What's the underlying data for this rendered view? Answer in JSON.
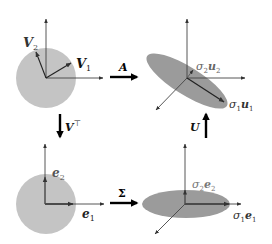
{
  "diagram": {
    "colors": {
      "circle_fill": "#c4c4c4",
      "ellipse_fill": "#9b9b9b",
      "axis": "#444444",
      "vector": "#222222",
      "big_arrow": "#000000",
      "label_gray": "#555555"
    },
    "panels": {
      "top_left": {
        "shape": "circle",
        "vectors": [
          {
            "id": "V1",
            "label_main": "V",
            "label_sub": "1"
          },
          {
            "id": "V2",
            "label_main": "V",
            "label_sub": "2"
          }
        ]
      },
      "top_right": {
        "shape": "tilted-ellipse",
        "vectors": [
          {
            "id": "s1u1",
            "label_sigma": "σ",
            "label_sigma_sub": "1",
            "label_main": "u",
            "label_sub": "1"
          },
          {
            "id": "s2u2",
            "label_sigma": "σ",
            "label_sigma_sub": "2",
            "label_main": "u",
            "label_sub": "2"
          }
        ]
      },
      "bottom_left": {
        "shape": "circle",
        "vectors": [
          {
            "id": "e1",
            "label_main": "e",
            "label_sub": "1"
          },
          {
            "id": "e2",
            "label_main": "e",
            "label_sub": "2"
          }
        ]
      },
      "bottom_right": {
        "shape": "flat-ellipse",
        "vectors": [
          {
            "id": "s1e1",
            "label_sigma": "σ",
            "label_sigma_sub": "1",
            "label_main": "e",
            "label_sub": "1"
          },
          {
            "id": "s2e2",
            "label_sigma": "σ",
            "label_sigma_sub": "2",
            "label_main": "e",
            "label_sub": "2"
          }
        ]
      }
    },
    "transforms": {
      "A": {
        "label": "A",
        "direction": "right"
      },
      "Vt": {
        "label_main": "V",
        "label_sup": "⊤",
        "direction": "down"
      },
      "Sigma": {
        "label": "Σ",
        "direction": "right"
      },
      "U": {
        "label": "U",
        "direction": "up"
      }
    }
  }
}
